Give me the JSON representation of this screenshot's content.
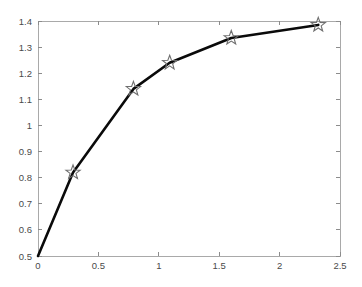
{
  "chart_data": {
    "type": "line",
    "title": "",
    "subtitle": "",
    "xlabel": "",
    "ylabel": "",
    "xlim": [
      0,
      2.5
    ],
    "ylim": [
      0.5,
      1.4
    ],
    "grid": false,
    "legend": null,
    "legend_position": "none",
    "marker": "star",
    "line_color": "#0a0a0a",
    "marker_color": "#6f6f6f",
    "axis_color": "#a9a9a9",
    "background_color": "#ffffff",
    "xticks": [
      0,
      0.5,
      1,
      1.5,
      2,
      2.5
    ],
    "xtick_labels": [
      "0",
      "0.5",
      "1",
      "1.5",
      "2",
      "2.5"
    ],
    "yticks": [
      0.5,
      0.6,
      0.7,
      0.8,
      0.9,
      1.0,
      1.1,
      1.2,
      1.3,
      1.4
    ],
    "ytick_labels": [
      "0.5",
      "0.6",
      "0.7",
      "0.8",
      "0.9",
      "1",
      "1.1",
      "1.2",
      "1.3",
      "1.4"
    ],
    "series": [
      {
        "name": "curve",
        "x": [
          0,
          0.29,
          0.79,
          1.09,
          1.6,
          2.32
        ],
        "y": [
          0.5,
          0.82,
          1.14,
          1.24,
          1.335,
          1.385
        ]
      }
    ],
    "markers": {
      "x": [
        0.29,
        0.79,
        1.09,
        1.6,
        2.32
      ],
      "y": [
        0.82,
        1.14,
        1.24,
        1.335,
        1.385
      ]
    }
  },
  "figure": {
    "plot_left_px": 38,
    "plot_right_px": 340,
    "plot_top_px": 21,
    "plot_bottom_px": 256
  }
}
